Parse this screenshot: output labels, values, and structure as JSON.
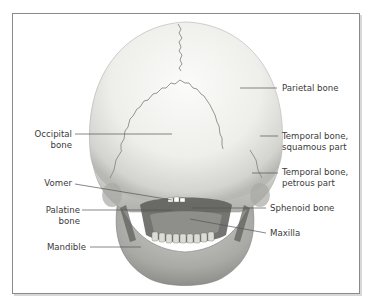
{
  "figure": {
    "labels_left": [
      {
        "id": "occipital",
        "lines": [
          "Occipital",
          "bone"
        ]
      },
      {
        "id": "vomer",
        "lines": [
          "Vomer"
        ]
      },
      {
        "id": "palatine",
        "lines": [
          "Palatine",
          "bone"
        ]
      },
      {
        "id": "mandible",
        "lines": [
          "Mandible"
        ]
      }
    ],
    "labels_right": [
      {
        "id": "parietal",
        "lines": [
          "Parietal bone"
        ]
      },
      {
        "id": "temporal_squamous",
        "lines": [
          "Temporal bone,",
          "squamous part"
        ]
      },
      {
        "id": "temporal_petrous",
        "lines": [
          "Temporal bone,",
          "petrous part"
        ]
      },
      {
        "id": "sphenoid",
        "lines": [
          "Sphenoid bone"
        ]
      },
      {
        "id": "maxilla",
        "lines": [
          "Maxilla"
        ]
      }
    ]
  },
  "colors": {
    "frame": "#8a8a8a",
    "leader": "#555555",
    "text": "#3a3a3a",
    "bone_light": "#f2f2ef",
    "bone_mid": "#d4d4d0",
    "bone_dark": "#8c8c88"
  }
}
